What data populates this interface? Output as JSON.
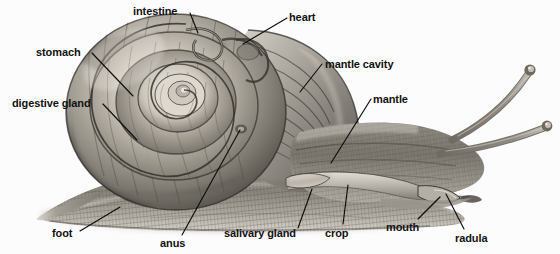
{
  "figure": {
    "background_color": "#fcfcfc",
    "label_color": "#121212",
    "leader_color": "#0d0d0d",
    "width": 560,
    "height": 254
  },
  "labels": [
    {
      "id": "intestine",
      "text": "intestine",
      "x": 133,
      "y": 5,
      "anchor": "start",
      "leader": [
        [
          190,
          13
        ],
        [
          198,
          33
        ]
      ]
    },
    {
      "id": "heart",
      "text": "heart",
      "x": 289,
      "y": 11,
      "anchor": "start",
      "leader": [
        [
          287,
          18
        ],
        [
          243,
          44
        ]
      ]
    },
    {
      "id": "stomach",
      "text": "stomach",
      "x": 36,
      "y": 46,
      "anchor": "start",
      "leader": [
        [
          92,
          53
        ],
        [
          133,
          96
        ]
      ]
    },
    {
      "id": "mantle-cavity",
      "text": "mantle cavity",
      "x": 325,
      "y": 58,
      "anchor": "start",
      "leader": [
        [
          322,
          64
        ],
        [
          300,
          92
        ]
      ]
    },
    {
      "id": "digestive-gland",
      "text": "digestive gland",
      "x": 12,
      "y": 97,
      "anchor": "start",
      "leader": [
        [
          103,
          104
        ],
        [
          137,
          140
        ]
      ]
    },
    {
      "id": "mantle",
      "text": "mantle",
      "x": 373,
      "y": 93,
      "anchor": "start",
      "leader": [
        [
          371,
          99
        ],
        [
          331,
          163
        ]
      ]
    },
    {
      "id": "foot",
      "text": "foot",
      "x": 52,
      "y": 227,
      "anchor": "start",
      "leader": [
        [
          80,
          231
        ],
        [
          120,
          207
        ]
      ]
    },
    {
      "id": "anus",
      "text": "anus",
      "x": 160,
      "y": 237,
      "anchor": "start",
      "leader": [
        [
          182,
          235
        ],
        [
          240,
          130
        ]
      ]
    },
    {
      "id": "salivary-gland",
      "text": "salivary gland",
      "x": 224,
      "y": 227,
      "anchor": "start",
      "leader": [
        [
          298,
          228
        ],
        [
          312,
          189
        ]
      ]
    },
    {
      "id": "crop",
      "text": "crop",
      "x": 325,
      "y": 227,
      "anchor": "start",
      "leader": [
        [
          343,
          224
        ],
        [
          348,
          185
        ]
      ]
    },
    {
      "id": "mouth",
      "text": "mouth",
      "x": 386,
      "y": 221,
      "anchor": "start",
      "leader": [
        [
          418,
          219
        ],
        [
          440,
          197
        ]
      ]
    },
    {
      "id": "radula",
      "text": "radula",
      "x": 455,
      "y": 232,
      "anchor": "start",
      "leader": [
        [
          464,
          229
        ],
        [
          446,
          194
        ]
      ]
    }
  ],
  "palette": {
    "shell_light": "#e3ded6",
    "shell_mid": "#9b968d",
    "shell_dark": "#4e4b46",
    "shell_darkest": "#2a2825",
    "body_light": "#cfcac2",
    "body_mid": "#8d887f",
    "body_dark": "#514d48",
    "shadow": "#b9b4ad"
  }
}
